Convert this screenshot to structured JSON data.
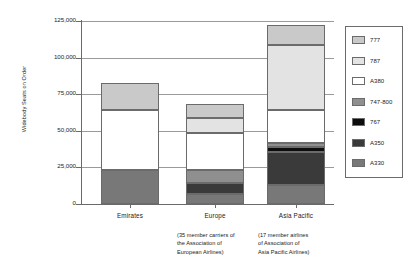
{
  "chart_data": {
    "type": "bar",
    "subtype": "stacked-vertical",
    "title": "",
    "xlabel": "",
    "ylabel": "Widebody Seats on Order",
    "ylim": [
      0,
      125000
    ],
    "ytick_labels": [
      "125,000",
      "100,000",
      "75,000",
      "50,000",
      "25,000",
      "0"
    ],
    "ytick_values": [
      125000,
      100000,
      75000,
      50000,
      25000,
      0
    ],
    "grid": true,
    "legend_position": "right",
    "categories": [
      "Emirates",
      "Europe",
      "Asia Pacific"
    ],
    "category_sublabels": [
      "",
      "(35 member carriers of the Association of European Airlines)",
      "(17 member airlines of Association of Asia Pacific Airlines)"
    ],
    "series": [
      {
        "name": "777",
        "color": "#c9c9c9",
        "values": [
          19000,
          9500,
          13700
        ]
      },
      {
        "name": "787",
        "color": "#e3e3e3",
        "values": [
          0,
          10000,
          44500
        ]
      },
      {
        "name": "A380",
        "color": "#ffffff",
        "values": [
          41000,
          25500,
          22500
        ]
      },
      {
        "name": "747-800",
        "color": "#8f8f8f",
        "values": [
          0,
          9000,
          2700
        ]
      },
      {
        "name": "767",
        "color": "#0d0d0d",
        "values": [
          0,
          0,
          3400
        ]
      },
      {
        "name": "A350",
        "color": "#3a3a3a",
        "values": [
          0,
          7500,
          22500
        ]
      },
      {
        "name": "A330",
        "color": "#787878",
        "values": [
          23000,
          6800,
          13000
        ]
      }
    ],
    "totals": [
      83000,
      68300,
      122300
    ]
  },
  "axis": {
    "y_title": "Widebody Seats on Order"
  },
  "categories": [
    {
      "label": "Emirates",
      "sub_lines": []
    },
    {
      "label": "Europe",
      "sub_lines": [
        "(35 member carriers of",
        "the Association of",
        "European Airlines)"
      ]
    },
    {
      "label": "Asia Pacific",
      "sub_lines": [
        "(17 member airlines",
        "of Association of",
        "Asia Pacific Airlines)"
      ]
    }
  ],
  "legend": {
    "items": [
      {
        "label": "777",
        "color": "#c9c9c9"
      },
      {
        "label": "787",
        "color": "#e3e3e3"
      },
      {
        "label": "A380",
        "color": "#ffffff"
      },
      {
        "label": "747-800",
        "color": "#8f8f8f"
      },
      {
        "label": "767",
        "color": "#0d0d0d"
      },
      {
        "label": "A350",
        "color": "#3a3a3a"
      },
      {
        "label": "A330",
        "color": "#787878"
      }
    ]
  },
  "colors": {
    "grid": "#9a9a9a",
    "axis": "#6a6a6a",
    "text": "#1a1a1a",
    "bar_border": "#6b6b6b"
  }
}
